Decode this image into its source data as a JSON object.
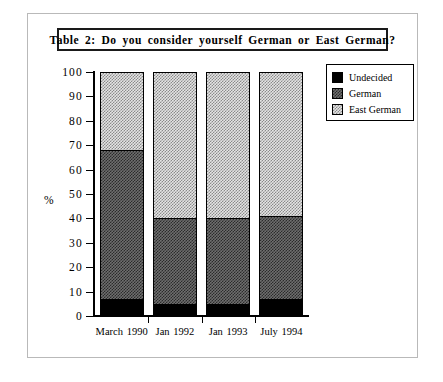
{
  "title": "Table 2:  Do  you  consider  yourself  German  or  East German?",
  "legend": {
    "items": [
      {
        "label": "Undecided",
        "swatch": "solid-black-swatch"
      },
      {
        "label": "German",
        "swatch": "dark-checker-swatch"
      },
      {
        "label": "East German",
        "swatch": "light-checker-swatch"
      }
    ]
  },
  "axes": {
    "ylabel": "%",
    "yticks": [
      "0",
      "10",
      "20",
      "30",
      "40",
      "50",
      "60",
      "70",
      "80",
      "90",
      "100"
    ]
  },
  "chart_data": {
    "type": "bar",
    "subtype": "stacked-percentage",
    "title": "Table 2:  Do  you  consider  yourself  German  or  East German?",
    "xlabel": "",
    "ylabel": "%",
    "ylim": [
      0,
      100
    ],
    "ytick_step": 10,
    "grid": false,
    "legend_position": "top-right",
    "categories": [
      "March 1990",
      "Jan 1992",
      "Jan 1993",
      "July 1994"
    ],
    "series": [
      {
        "name": "Undecided",
        "values": [
          7,
          5,
          5,
          7
        ]
      },
      {
        "name": "German",
        "values": [
          61,
          35,
          35,
          34
        ]
      },
      {
        "name": "East German",
        "values": [
          32,
          60,
          60,
          59
        ]
      }
    ],
    "cumulative_boundaries": [
      {
        "category": "March 1990",
        "undecided_top": 7,
        "german_top": 68,
        "east_german_top": 100
      },
      {
        "category": "Jan 1992",
        "undecided_top": 5,
        "german_top": 40,
        "east_german_top": 100
      },
      {
        "category": "Jan 1993",
        "undecided_top": 5,
        "german_top": 40,
        "east_german_top": 100
      },
      {
        "category": "July 1994",
        "undecided_top": 7,
        "german_top": 41,
        "east_german_top": 100
      }
    ]
  }
}
